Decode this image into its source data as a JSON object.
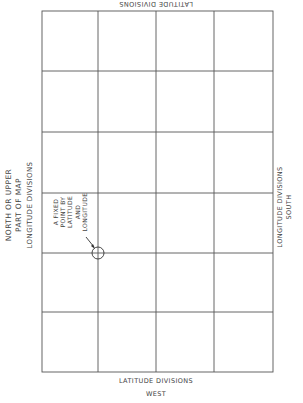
{
  "labels": {
    "top": "LATITUDE DIVISIONS",
    "bottom_line1": "LATITUDE DIVISIONS",
    "bottom_line2": "WEST",
    "left_line1": "NORTH OR UPPER",
    "left_line2": "PART OF MAP",
    "left_line3": "LONGITUDE DIVISIONS",
    "right_line1": "LONGITUDE DIVISIONS",
    "right_line2": "SOUTH",
    "point_line1": "A FIXED",
    "point_line2": "POINT BY",
    "point_line3": "LATITUDE",
    "point_line4": "AND",
    "point_line5": "LONGITUDE"
  },
  "grid": {
    "columns": 4,
    "rows": 6,
    "line_color": "#555555"
  },
  "fixed_point": {
    "column_line": 1,
    "row_line": 4
  }
}
